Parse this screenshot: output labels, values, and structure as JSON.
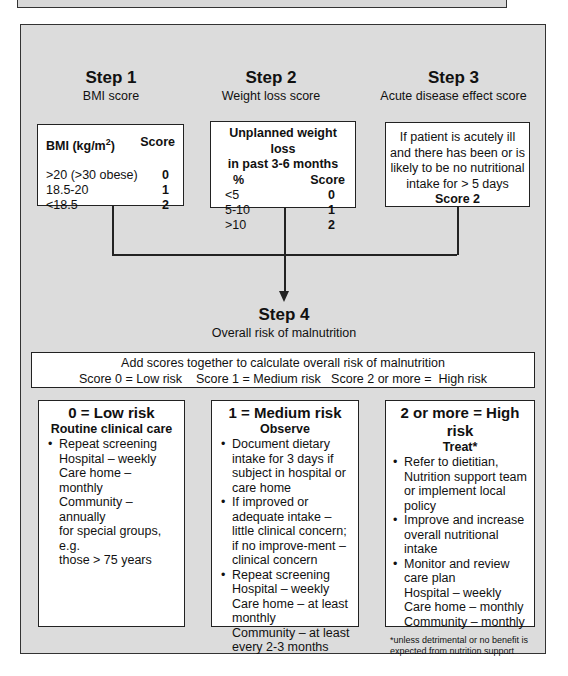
{
  "steps": [
    {
      "title": "Step 1",
      "subtitle": "BMI score"
    },
    {
      "title": "Step 2",
      "subtitle": "Weight loss score"
    },
    {
      "title": "Step 3",
      "subtitle": "Acute disease effect score"
    },
    {
      "title": "Step 4",
      "subtitle": "Overall risk of malnutrition"
    }
  ],
  "bmi_box": {
    "header_label": "BMI (kg/m",
    "header_sup": "2",
    "header_label_end": ")",
    "score_header": "Score",
    "rows": [
      {
        "range": ">20 (>30 obese)",
        "score": "0"
      },
      {
        "range": "18.5-20",
        "score": "1"
      },
      {
        "range": "<18.5",
        "score": "2"
      }
    ]
  },
  "weight_box": {
    "title_line1": "Unplanned weight loss",
    "title_line2": "in past 3-6 months",
    "col1_header": "%",
    "col2_header": "Score",
    "rows": [
      {
        "range": "<5",
        "score": "0"
      },
      {
        "range": "5-10",
        "score": "1"
      },
      {
        "range": ">10",
        "score": "2"
      }
    ]
  },
  "acute_box": {
    "lines": [
      "If patient is acutely ill",
      "and there has been or is",
      "likely to be no nutritional",
      "intake for > 5 days"
    ],
    "score": "Score 2"
  },
  "summary_box": {
    "line1": "Add scores together to calculate overall risk of malnutrition",
    "line2": "Score 0 = Low risk    Score 1 = Medium risk   Score 2 or more =  High risk"
  },
  "risk_boxes": {
    "low": {
      "title": "0 = Low risk",
      "subtitle": "Routine clinical care",
      "bullet1": "Repeat screening",
      "bullet1_lines": [
        "Hospital – weekly",
        "Care home – monthly",
        "Community – annually",
        "for special groups, e.g.",
        "those > 75 years"
      ]
    },
    "medium": {
      "title": "1 = Medium risk",
      "subtitle": "Observe",
      "bullet1": "Document dietary intake for 3 days if subject in hospital or care home",
      "bullet2": "If improved or adequate intake – little clinical concern; if no improve-ment – clinical concern",
      "bullet3": "Repeat screening",
      "bullet3_lines": [
        "Hospital – weekly",
        "Care home – at least",
        "monthly",
        "Community – at least",
        "every 2-3 months"
      ]
    },
    "high": {
      "title": "2 or more = High risk",
      "subtitle": "Treat*",
      "bullet1": "Refer to dietitian, Nutrition support team or implement local policy",
      "bullet2": "Improve and increase overall nutritional intake",
      "bullet3": "Monitor and review care plan",
      "bullet3_lines": [
        "Hospital – weekly",
        "Care home – monthly",
        "Community – monthly"
      ],
      "footnote": "*unless detrimental or no benefit is expected from nutrition support"
    }
  },
  "colors": {
    "panel_bg": "#dcdcdc",
    "box_bg": "#ffffff",
    "border": "#222222"
  }
}
